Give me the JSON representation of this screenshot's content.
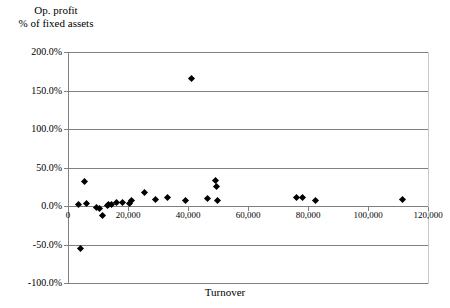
{
  "chart_data": {
    "type": "scatter",
    "title": "",
    "ylabel": "Op. profit\n% of fixed assets",
    "xlabel": "Turnover",
    "xlim": [
      0,
      120000
    ],
    "ylim": [
      -100,
      200
    ],
    "grid": true,
    "legend": "none",
    "yticks": [
      "200.0%",
      "150.0%",
      "100.0%",
      "50.0%",
      "0.0%",
      "-50.0%",
      "-100.0%"
    ],
    "ytick_values": [
      200,
      150,
      100,
      50,
      0,
      -50,
      -100
    ],
    "xticks": [
      "0",
      "20,000",
      "40,000",
      "60,000",
      "80,000",
      "100,000",
      "120,000"
    ],
    "xtick_values": [
      0,
      20000,
      40000,
      60000,
      80000,
      100000,
      120000
    ],
    "points": [
      {
        "x": 3500,
        "y": 2
      },
      {
        "x": 4300,
        "y": -55
      },
      {
        "x": 5500,
        "y": 32
      },
      {
        "x": 6000,
        "y": 3
      },
      {
        "x": 9500,
        "y": -2
      },
      {
        "x": 10500,
        "y": -3
      },
      {
        "x": 11500,
        "y": -12
      },
      {
        "x": 13000,
        "y": 1
      },
      {
        "x": 13500,
        "y": 2
      },
      {
        "x": 14500,
        "y": 2
      },
      {
        "x": 16000,
        "y": 4
      },
      {
        "x": 18000,
        "y": 4
      },
      {
        "x": 20500,
        "y": 3
      },
      {
        "x": 21000,
        "y": 7
      },
      {
        "x": 25500,
        "y": 17
      },
      {
        "x": 29000,
        "y": 8
      },
      {
        "x": 33000,
        "y": 11
      },
      {
        "x": 39000,
        "y": 7
      },
      {
        "x": 41000,
        "y": 165
      },
      {
        "x": 46500,
        "y": 10
      },
      {
        "x": 49000,
        "y": 33
      },
      {
        "x": 49500,
        "y": 25
      },
      {
        "x": 49800,
        "y": 7
      },
      {
        "x": 76000,
        "y": 11
      },
      {
        "x": 78000,
        "y": 11
      },
      {
        "x": 82500,
        "y": 7
      },
      {
        "x": 111500,
        "y": 8
      }
    ]
  }
}
